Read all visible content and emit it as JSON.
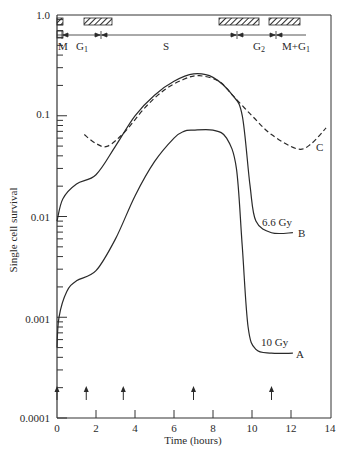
{
  "chart_data": {
    "type": "line",
    "title": "",
    "xlabel": "Time (hours)",
    "ylabel": "Single cell survival",
    "xlim": [
      0,
      14
    ],
    "ylim": [
      0.0001,
      1.0
    ],
    "yscale": "log",
    "x_ticks": [
      "0",
      "2",
      "4",
      "6",
      "8",
      "10",
      "12",
      "14"
    ],
    "y_ticks": [
      "1.0",
      "0.1",
      "0.01",
      "0.001",
      "0.0001"
    ],
    "grid": false,
    "series": [
      {
        "name": "A",
        "label": "10 Gy",
        "style": "solid",
        "points": [
          [
            0.0,
            0.0005
          ],
          [
            0.1,
            0.001
          ],
          [
            0.5,
            0.0018
          ],
          [
            1.0,
            0.0023
          ],
          [
            2.0,
            0.0029
          ],
          [
            3.0,
            0.006
          ],
          [
            4.0,
            0.016
          ],
          [
            5.0,
            0.035
          ],
          [
            6.0,
            0.06
          ],
          [
            6.5,
            0.07
          ],
          [
            7.0,
            0.072
          ],
          [
            8.0,
            0.072
          ],
          [
            8.7,
            0.06
          ],
          [
            9.2,
            0.03
          ],
          [
            9.5,
            0.005
          ],
          [
            9.8,
            0.0008
          ],
          [
            10.2,
            0.00048
          ],
          [
            11.0,
            0.00044
          ],
          [
            12.1,
            0.00044
          ]
        ]
      },
      {
        "name": "B",
        "label": "6.6 Gy",
        "style": "solid",
        "points": [
          [
            0.0,
            0.009
          ],
          [
            0.3,
            0.015
          ],
          [
            1.0,
            0.021
          ],
          [
            2.0,
            0.026
          ],
          [
            3.0,
            0.05
          ],
          [
            4.0,
            0.1
          ],
          [
            5.0,
            0.16
          ],
          [
            6.0,
            0.22
          ],
          [
            7.0,
            0.26
          ],
          [
            8.0,
            0.24
          ],
          [
            9.0,
            0.16
          ],
          [
            9.5,
            0.1
          ],
          [
            9.9,
            0.02
          ],
          [
            10.2,
            0.009
          ],
          [
            11.0,
            0.0069
          ],
          [
            12.1,
            0.0069
          ]
        ]
      },
      {
        "name": "C",
        "label": "C",
        "style": "dashed",
        "points": [
          [
            1.4,
            0.065
          ],
          [
            2.0,
            0.053
          ],
          [
            2.6,
            0.05
          ],
          [
            3.5,
            0.07
          ],
          [
            4.5,
            0.12
          ],
          [
            5.5,
            0.18
          ],
          [
            6.5,
            0.23
          ],
          [
            7.3,
            0.25
          ],
          [
            8.3,
            0.22
          ],
          [
            9.0,
            0.16
          ],
          [
            10.0,
            0.1
          ],
          [
            11.0,
            0.065
          ],
          [
            12.3,
            0.047
          ],
          [
            13.0,
            0.052
          ],
          [
            13.8,
            0.076
          ]
        ]
      }
    ],
    "arrows_x": [
      0,
      1.5,
      3.4,
      7.0,
      11.0
    ],
    "phases": [
      {
        "label": "M",
        "start": 0,
        "end": 0.3
      },
      {
        "label": "G1",
        "start": 0.3,
        "end": 2.3
      },
      {
        "label": "S",
        "start": 2.3,
        "end": 9.3
      },
      {
        "label": "G2",
        "start": 9.3,
        "end": 11.3
      },
      {
        "label": "M+G1",
        "start": 11.3,
        "end": 12.6
      }
    ],
    "hatched_bars": [
      [
        0,
        0.3
      ],
      [
        1.4,
        2.8
      ],
      [
        8.3,
        10.4
      ],
      [
        10.9,
        12.5
      ]
    ],
    "annotations": [
      "6.6 Gy",
      "B",
      "10 Gy",
      "A",
      "C"
    ]
  },
  "labels": {
    "xlabel": "Time (hours)",
    "ylabel": "Single cell survival",
    "x_ticks": [
      "0",
      "2",
      "4",
      "6",
      "8",
      "10",
      "12",
      "14"
    ],
    "y_ticks": [
      "1.0",
      "0.1",
      "0.01",
      "0.001",
      "0.0001"
    ],
    "phase_M": "M",
    "phase_G1": "G",
    "phase_G1_sub": "1",
    "phase_S": "S",
    "phase_G2": "G",
    "phase_G2_sub": "2",
    "phase_MG1": "M+G",
    "phase_MG1_sub": "1",
    "curve_B_dose": "6.6 Gy",
    "curve_B_name": "B",
    "curve_A_dose": "10 Gy",
    "curve_A_name": "A",
    "curve_C_name": "C"
  }
}
